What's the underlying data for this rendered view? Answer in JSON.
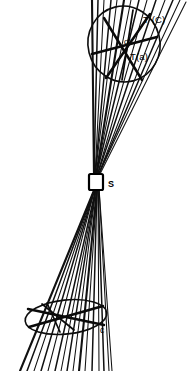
{
  "figure": {
    "background_color": "#ffffff",
    "ink_color": "#111111",
    "width": 188,
    "height": 371
  },
  "labels": {
    "upper_ellipse_outer": "T (C)",
    "upper_ellipse_inner": "T(a)",
    "diameter_marker": "d'",
    "slit": "S",
    "lower_ellipse": "c"
  },
  "elements": {
    "upper_ellipse_name": "upper-cross-section-ellipse",
    "lower_ellipse_name": "lower-cross-section-ellipse",
    "slit_name": "slit-aperture",
    "upper_fan_name": "upper-ray-fan",
    "lower_fan_name": "lower-ray-fan"
  },
  "geometry": {
    "slit_center": "96,182",
    "upper_ellipse_center": "124,45",
    "lower_ellipse_center": "66,317",
    "upper_ray_count": 14,
    "lower_ray_count": 16
  }
}
